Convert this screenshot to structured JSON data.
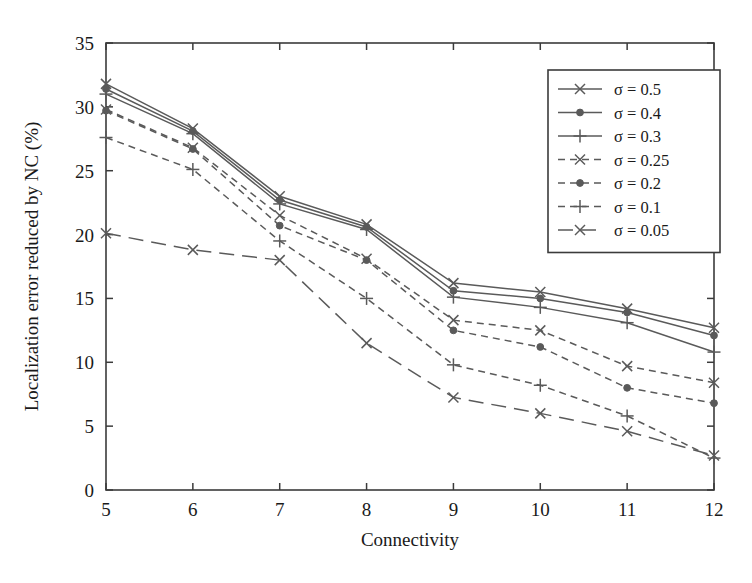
{
  "chart_data": {
    "type": "line",
    "title": "",
    "xlabel": "Connectivity",
    "ylabel": "Localization error reduced by NC (%)",
    "x": [
      5,
      6,
      7,
      8,
      9,
      10,
      11,
      12
    ],
    "xlim": [
      5,
      12
    ],
    "ylim": [
      0,
      35
    ],
    "xticks": [
      "5",
      "6",
      "7",
      "8",
      "9",
      "10",
      "11",
      "12"
    ],
    "yticks": [
      "0",
      "5",
      "10",
      "15",
      "20",
      "25",
      "30",
      "35"
    ],
    "grid": false,
    "legend_position": "upper-right",
    "series": [
      {
        "name": "σ = 0.5",
        "marker": "x-cross",
        "linestyle": "solid",
        "values": [
          31.8,
          28.3,
          23.0,
          20.8,
          16.2,
          15.5,
          14.2,
          12.7
        ]
      },
      {
        "name": "σ = 0.4",
        "marker": "dot",
        "linestyle": "solid",
        "values": [
          31.4,
          28.1,
          22.7,
          20.6,
          15.6,
          15.0,
          13.9,
          12.1
        ]
      },
      {
        "name": "σ = 0.3",
        "marker": "plus",
        "linestyle": "solid",
        "values": [
          31.0,
          27.9,
          22.4,
          20.4,
          15.1,
          14.3,
          13.1,
          10.8
        ]
      },
      {
        "name": "σ = 0.25",
        "marker": "x-cross",
        "linestyle": "dotted",
        "values": [
          29.8,
          26.8,
          21.5,
          18.1,
          13.3,
          12.5,
          9.7,
          8.4
        ]
      },
      {
        "name": "σ = 0.2",
        "marker": "dot",
        "linestyle": "dotted",
        "values": [
          29.7,
          26.7,
          20.7,
          18.0,
          12.5,
          11.2,
          8.0,
          6.8
        ]
      },
      {
        "name": "σ = 0.1",
        "marker": "plus",
        "linestyle": "dotted",
        "values": [
          27.6,
          25.1,
          19.5,
          15.0,
          9.8,
          8.2,
          5.8,
          2.5
        ]
      },
      {
        "name": "σ = 0.05",
        "marker": "x-cross",
        "linestyle": "dashed",
        "values": [
          20.1,
          18.8,
          18.0,
          11.5,
          7.25,
          6.0,
          4.6,
          2.7
        ]
      }
    ],
    "colors": {
      "line": "#5a5a5a",
      "axis": "#3b3b3b",
      "text": "#1a1a1a",
      "background": "#ffffff"
    }
  }
}
